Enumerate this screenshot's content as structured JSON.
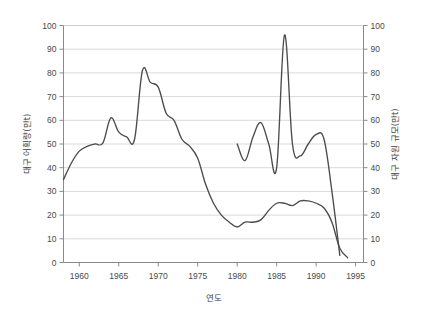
{
  "chart_data": {
    "type": "line",
    "title": "",
    "xlabel": "연도",
    "ylabel": "대구 어획량(만t)",
    "y2label": "대구 자원 규모(만t)",
    "xlim": [
      1958,
      1996
    ],
    "ylim": [
      0,
      100
    ],
    "y2lim": [
      0,
      100
    ],
    "grid": true,
    "legend": "none",
    "xticks": [
      1960,
      1965,
      1970,
      1975,
      1980,
      1985,
      1990,
      1995
    ],
    "xtick_labels": [
      "1960",
      "1965",
      "1970",
      "1975",
      "1980",
      "1985",
      "1990",
      "1995"
    ],
    "yticks": [
      0,
      10,
      20,
      30,
      40,
      50,
      60,
      70,
      80,
      90,
      100
    ],
    "ytick_labels": [
      "0",
      "10",
      "20",
      "30",
      "40",
      "50",
      "60",
      "70",
      "80",
      "90",
      "100"
    ],
    "y2ticks": [
      0,
      10,
      20,
      30,
      40,
      50,
      60,
      70,
      80,
      90,
      100
    ],
    "y2tick_labels": [
      "0",
      "10",
      "20",
      "30",
      "40",
      "50",
      "60",
      "70",
      "80",
      "90",
      "100"
    ],
    "series": [
      {
        "name": "대구 어획량(만t)",
        "axis": "left",
        "color": "#4c4c4c",
        "x": [
          1958,
          1959,
          1960,
          1961,
          1962,
          1963,
          1964,
          1965,
          1966,
          1967,
          1968,
          1969,
          1970,
          1971,
          1972,
          1973,
          1974,
          1975,
          1976,
          1977,
          1978,
          1979,
          1980,
          1981,
          1982,
          1983,
          1984,
          1985,
          1986,
          1987,
          1988,
          1989,
          1990,
          1991,
          1992,
          1993,
          1994
        ],
        "values": [
          35,
          42,
          47,
          49,
          50,
          50.5,
          61,
          55,
          53,
          52,
          81,
          76,
          74,
          63,
          60,
          52,
          49,
          44,
          33,
          25,
          20,
          17,
          15,
          17,
          17,
          18,
          22,
          25,
          25,
          24,
          26,
          26,
          25,
          23,
          17,
          6,
          2
        ]
      },
      {
        "name": "대구 자원 규모(만t)",
        "axis": "right",
        "color": "#4c4c4c",
        "x": [
          1980,
          1981,
          1982,
          1983,
          1984,
          1985,
          1986,
          1987,
          1988,
          1989,
          1990,
          1991,
          1992,
          1993
        ],
        "values": [
          50,
          43,
          53,
          59,
          50,
          40,
          96,
          50,
          45,
          50,
          54,
          52,
          30,
          3
        ]
      }
    ]
  }
}
